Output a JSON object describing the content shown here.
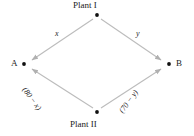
{
  "diagram": {
    "type": "transportation-network",
    "nodes": [
      {
        "id": "plant-1",
        "label": "Plant I",
        "x": 97,
        "y": 15
      },
      {
        "id": "dest-a",
        "label": "A",
        "x": 24,
        "y": 64
      },
      {
        "id": "dest-b",
        "label": "B",
        "x": 169,
        "y": 64
      },
      {
        "id": "plant-2",
        "label": "Plant II",
        "x": 97,
        "y": 112
      }
    ],
    "edges": [
      {
        "id": "edge-plant1-a",
        "from": "plant-1",
        "to": "dest-a",
        "label": "x"
      },
      {
        "id": "edge-plant1-b",
        "from": "plant-1",
        "to": "dest-b",
        "label": "y"
      },
      {
        "id": "edge-plant2-a",
        "from": "plant-2",
        "to": "dest-a",
        "label": "(80 − x)"
      },
      {
        "id": "edge-plant2-b",
        "from": "plant-2",
        "to": "dest-b",
        "label": "(70 − y)"
      }
    ],
    "colors": {
      "line": "#b8b8b8",
      "arrow": "#b0b0b0",
      "node_dot": "#111111",
      "text": "#1a1a1a"
    }
  }
}
